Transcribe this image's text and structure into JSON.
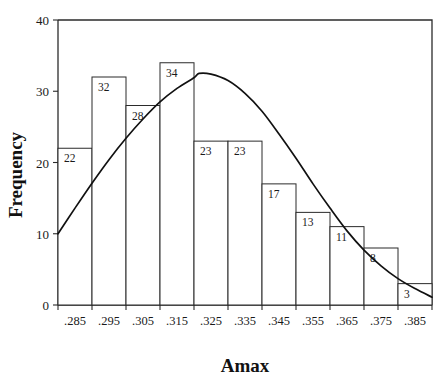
{
  "figure": {
    "background_color": "#ffffff",
    "foreground_color": "#1a1a1a",
    "bar_fill_color": "#ffffff",
    "bar_stroke_color": "#2b2b2b",
    "curve_color": "#111111"
  },
  "axes": {
    "x_title": "Amax",
    "y_title": "Frequency",
    "y_ticks": [
      "0",
      "10",
      "20",
      "30",
      "40"
    ],
    "x_ticks": [
      ".285",
      ".295",
      ".305",
      ".315",
      ".325",
      ".335",
      ".345",
      ".355",
      ".365",
      ".375",
      ".385"
    ]
  },
  "chart_data": {
    "type": "bar",
    "title": "",
    "subtitle": "",
    "xlabel": "Amax",
    "ylabel": "Frequency",
    "categories": [
      ".285",
      ".295",
      ".305",
      ".315",
      ".325",
      ".335",
      ".345",
      ".355",
      ".365",
      ".375",
      ".385"
    ],
    "values": [
      22,
      32,
      28,
      34,
      23,
      23,
      17,
      13,
      11,
      8,
      3
    ],
    "bar_labels": [
      "22",
      "32",
      "28",
      "34",
      "23",
      "23",
      "17",
      "13",
      "11",
      "8",
      "3"
    ],
    "bin_width": 0.01,
    "bin_edges": [
      0.28,
      0.29,
      0.3,
      0.31,
      0.32,
      0.33,
      0.34,
      0.35,
      0.36,
      0.37,
      0.38,
      0.39
    ],
    "xlim": [
      0.28,
      0.39
    ],
    "ylim": [
      0,
      40
    ],
    "ytick_values": [
      0,
      10,
      20,
      30,
      40
    ],
    "xtick_values": [
      0.285,
      0.295,
      0.305,
      0.315,
      0.325,
      0.335,
      0.345,
      0.355,
      0.365,
      0.375,
      0.385
    ],
    "grid": false,
    "legend": false,
    "legend_position": "none",
    "total_count": 214,
    "overlay": {
      "type": "line",
      "name": "normal-distribution-curve",
      "description": "fitted normal density curve scaled to frequency",
      "mean": 0.3215,
      "peak_value": 32.5,
      "start_value": 10.0,
      "end_value": 1.1,
      "points": [
        {
          "x": 0.28,
          "y": 10.0
        },
        {
          "x": 0.285,
          "y": 13.6
        },
        {
          "x": 0.29,
          "y": 17.1
        },
        {
          "x": 0.295,
          "y": 20.4
        },
        {
          "x": 0.3,
          "y": 23.4
        },
        {
          "x": 0.305,
          "y": 26.1
        },
        {
          "x": 0.31,
          "y": 28.5
        },
        {
          "x": 0.315,
          "y": 30.4
        },
        {
          "x": 0.32,
          "y": 31.9
        },
        {
          "x": 0.3215,
          "y": 32.5
        },
        {
          "x": 0.325,
          "y": 32.4
        },
        {
          "x": 0.33,
          "y": 31.5
        },
        {
          "x": 0.335,
          "y": 29.7
        },
        {
          "x": 0.34,
          "y": 27.2
        },
        {
          "x": 0.345,
          "y": 24.0
        },
        {
          "x": 0.35,
          "y": 20.6
        },
        {
          "x": 0.355,
          "y": 17.0
        },
        {
          "x": 0.36,
          "y": 13.6
        },
        {
          "x": 0.365,
          "y": 10.4
        },
        {
          "x": 0.37,
          "y": 7.7
        },
        {
          "x": 0.375,
          "y": 5.5
        },
        {
          "x": 0.38,
          "y": 3.7
        },
        {
          "x": 0.385,
          "y": 2.3
        },
        {
          "x": 0.39,
          "y": 1.1
        }
      ]
    }
  }
}
